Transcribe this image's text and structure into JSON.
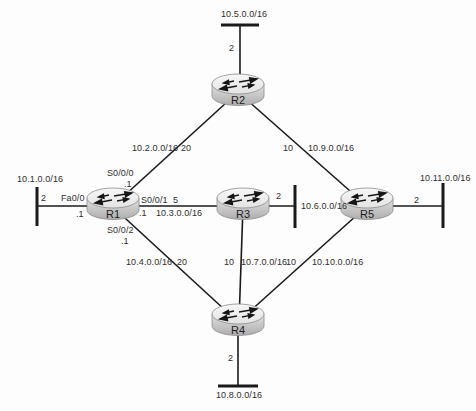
{
  "routers": {
    "r1": "R1",
    "r2": "R2",
    "r3": "R3",
    "r4": "R4",
    "r5": "R5"
  },
  "links": [
    {
      "from": "R1",
      "to": "R2",
      "interface": "S0/0/0",
      "address": ".1",
      "network": "10.2.0.0/16",
      "cost": "20"
    },
    {
      "from": "R1",
      "to": "R3",
      "interface": "S0/0/1",
      "address": ".1",
      "network": "10.3.0.0/16",
      "cost": "5"
    },
    {
      "from": "R1",
      "to": "R4",
      "interface": "S0/0/2",
      "address": ".1",
      "network": "10.4.0.0/16",
      "cost": "20"
    },
    {
      "from": "R2",
      "to": "R5",
      "network": "10.9.0.0/16",
      "cost": "10"
    },
    {
      "from": "R3",
      "to": "R4",
      "network": "10.7.0.0/16",
      "cost": "10"
    },
    {
      "from": "R4",
      "to": "R5",
      "network": "10.10.0.0/16",
      "cost": "10"
    }
  ],
  "stubs": [
    {
      "router": "R1",
      "network": "10.1.0.0/16",
      "cost": "2",
      "interface": "Fa0/0",
      "address": ".1",
      "side": "left"
    },
    {
      "router": "R2",
      "network": "10.5.0.0/16",
      "cost": "2",
      "side": "top"
    },
    {
      "router": "R3",
      "network": "10.6.0.0/16",
      "cost": "2",
      "side": "right"
    },
    {
      "router": "R5",
      "network": "10.11.0.0/16",
      "cost": "2",
      "side": "right"
    },
    {
      "router": "R4",
      "network": "10.8.0.0/16",
      "cost": "2",
      "side": "bottom"
    }
  ],
  "colors": {
    "line": "#1a1a1a",
    "text": "#2e2e2e",
    "router_top": "#f2f2f2",
    "router_body": "#cfcfcf",
    "router_outline": "#8d8d8d"
  }
}
